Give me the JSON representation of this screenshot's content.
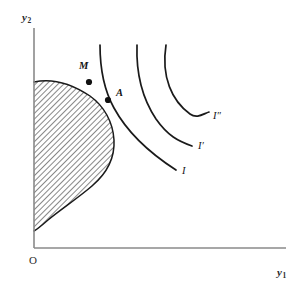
{
  "figure": {
    "background_color": "#ffffff",
    "axis_color": "#8a8a8a",
    "curve_color": "#1a1a1a",
    "hatch_color": "#2f2f2f",
    "label_color": "#2b2b2b",
    "origin": {
      "label": "O",
      "x": 33,
      "y": 232
    },
    "axes": {
      "y_axis": {
        "label": "y",
        "subscript": "2",
        "label_x": 22,
        "label_y": 16
      },
      "x_axis": {
        "label": "y",
        "subscript": "1",
        "label_x": 278,
        "label_y": 271
      }
    },
    "points": [
      {
        "name": "M",
        "label": "M",
        "x": 89,
        "y": 82,
        "label_x": 80,
        "label_y": 66
      },
      {
        "name": "A",
        "label": "A",
        "x": 108,
        "y": 100,
        "label_x": 116,
        "label_y": 92
      }
    ],
    "curves": [
      {
        "name": "indifference-curve-I",
        "label": "I",
        "label_x": 182,
        "label_y": 170
      },
      {
        "name": "indifference-curve-I-prime",
        "label": "I′",
        "label_x": 198,
        "label_y": 145
      },
      {
        "name": "indifference-curve-I-double-prime",
        "label": "I″",
        "label_x": 213,
        "label_y": 115
      }
    ],
    "region": {
      "name": "feasible-production-set",
      "fill": "hatched-diagonal"
    }
  }
}
